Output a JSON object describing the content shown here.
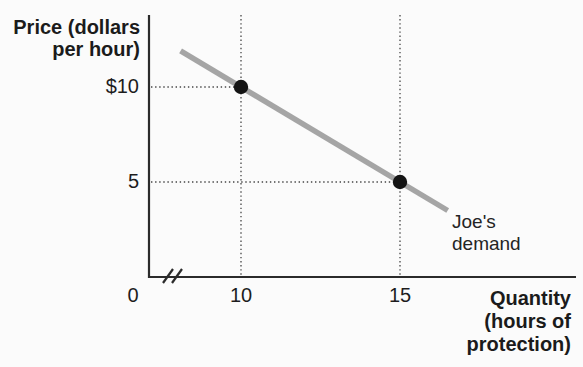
{
  "chart_data": {
    "type": "line",
    "title": "",
    "xlabel": "Quantity (hours of protection)",
    "ylabel": "Price (dollars per hour)",
    "series": [
      {
        "name": "Joe's demand",
        "points": [
          {
            "x": 10,
            "y": 10
          },
          {
            "x": 15,
            "y": 5
          }
        ],
        "line_extent_x": [
          8.1,
          16.5
        ],
        "color": "#a5a5a5"
      }
    ],
    "x_ticks": [
      {
        "value": 0,
        "label": "0",
        "at_break_origin": true
      },
      {
        "value": 10,
        "label": "10"
      },
      {
        "value": 15,
        "label": "15"
      }
    ],
    "y_ticks": [
      {
        "value": 10,
        "label": "$10"
      },
      {
        "value": 5,
        "label": "5"
      }
    ],
    "axis_break_on_x": true,
    "guide_lines": {
      "style": "dotted",
      "vertical_full_height": true,
      "horizontal_to_y_axis": true
    },
    "legend_position": "annotation near line end",
    "xlim_shown": [
      0,
      17
    ],
    "ylim_shown": [
      0,
      13
    ]
  },
  "labels": {
    "y_axis_title": [
      "Price (dollars",
      "per hour)"
    ],
    "x_axis_title": [
      "Quantity",
      "(hours of",
      "protection)"
    ],
    "curve_label": [
      "Joe's",
      "demand"
    ]
  },
  "colors": {
    "background": "#fbfbfb",
    "axis": "#2b2b2b",
    "text": "#1d1d1d",
    "demand_line": "#a5a5a5",
    "point": "#141414",
    "guide": "#454545"
  }
}
